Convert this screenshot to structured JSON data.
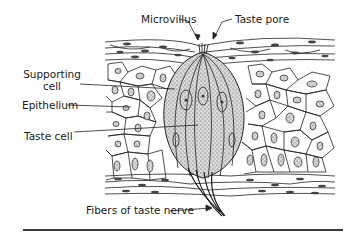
{
  "figure": {
    "labels": {
      "microvillus": "Microvillus",
      "taste_pore": "Taste pore",
      "supporting_cell_line1": "Supporting",
      "supporting_cell_line2": "cell",
      "epithelium": "Epithelium",
      "taste_cell": "Taste cell",
      "fibers": "Fibers of taste nerve"
    },
    "colors": {
      "ink": "#1a1a1a",
      "stipple": "#8a8a8a",
      "background": "#ffffff"
    }
  }
}
